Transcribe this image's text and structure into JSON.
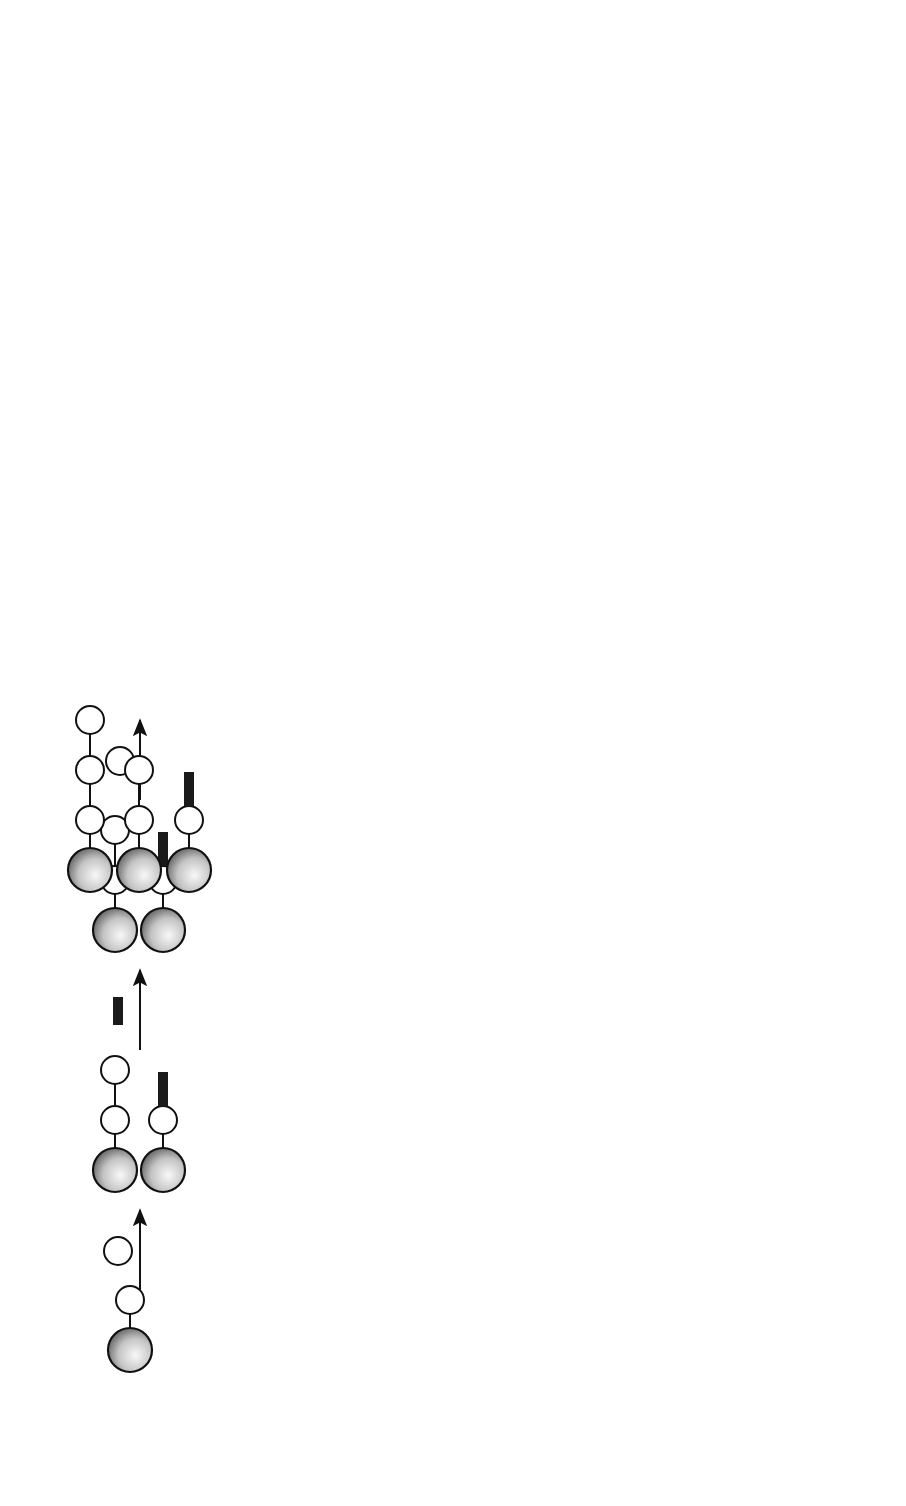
{
  "figure": {
    "orientation": "rotated-90-ccw",
    "panel_a": {
      "label": "(a)",
      "steps": [
        "Coupling",
        "Capping",
        "Coupling",
        "Capping",
        "Cleavage"
      ],
      "separation": {
        "line1": "F-separation",
        "line2": "Centrifugation"
      },
      "outcome": {
        "product": "Product",
        "plus": "+",
        "byproduct": "Byproduct"
      },
      "legend": [
        {
          "icon": "solid-support-icon",
          "label": "Solid support"
        },
        {
          "icon": "monomer-icon",
          "label": "Monomer"
        },
        {
          "icon": "fluorous-cap-icon",
          "label": "Fluorous capping reagent"
        },
        {
          "icon": "acetyl-cap-icon",
          "label": "Acetyl capping reagent"
        }
      ],
      "reagent": {
        "left_group": "F3CO2S",
        "right_group": "SO2CF3",
        "n": "N",
        "i": "I",
        "chain": "C6F13",
        "caption": "Capping reagent"
      }
    },
    "panel_b": {
      "label": "(b)",
      "steps": [
        "Coupling",
        "Capping",
        "Coupling",
        "Capping",
        "Tagging",
        "Cleavage"
      ],
      "separation": {
        "line1": "(i) F-separation",
        "line2": "(ii) Detagging"
      },
      "outcome": {
        "product": "Product",
        "plus": "+",
        "byproduct": "Byproduct"
      },
      "tags": [
        {
          "name": "F-Msc tag",
          "chain": "C8F17",
          "acyl": "Cl"
        },
        {
          "name": "F-Cbz tag",
          "chain": "C8F17",
          "acyl": "Cl"
        }
      ]
    },
    "colors": {
      "fluorous_cap": "#1a1a1a",
      "acetyl_cap": "#b3b3b3",
      "bead_light": "#f4f4f4",
      "bead_dark": "#6a6a6a"
    }
  }
}
